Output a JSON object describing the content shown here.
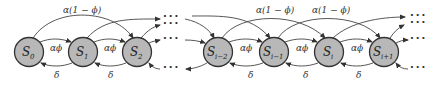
{
  "diagram": {
    "type": "state-transition-chain",
    "nodes": [
      {
        "id": "S0",
        "base": "S",
        "sub": "0",
        "cx": 29
      },
      {
        "id": "S1",
        "base": "S",
        "sub": "1",
        "cx": 83
      },
      {
        "id": "S2",
        "base": "S",
        "sub": "2",
        "cx": 137
      },
      {
        "id": "Si-2",
        "base": "S",
        "sub": "i−2",
        "cx": 218
      },
      {
        "id": "Si-1",
        "base": "S",
        "sub": "i−1",
        "cx": 274
      },
      {
        "id": "Si",
        "base": "S",
        "sub": "i",
        "cx": 329
      },
      {
        "id": "Si+1",
        "base": "S",
        "sub": "i+1",
        "cx": 384
      }
    ],
    "labels": {
      "forward_near": "αϕ",
      "forward_skip": "α(1 − ϕ)",
      "backward": "δ",
      "ellipsis": "···"
    },
    "edge_labels": {
      "af_0": "αϕ",
      "af_1": "αϕ",
      "af_2": "αϕ",
      "af_3": "αϕ",
      "af_4": "αϕ",
      "skip_0": "α(1 − ϕ)",
      "skip_1": "α(1 − ϕ)",
      "skip_2": "α(1 − ϕ)",
      "d_0": "δ",
      "d_1": "δ",
      "d_2": "δ",
      "d_3": "δ",
      "d_4": "δ"
    },
    "colors": {
      "node_fill": "#b8b8b8",
      "node_stroke": "#333333",
      "edge": "#444444"
    }
  }
}
